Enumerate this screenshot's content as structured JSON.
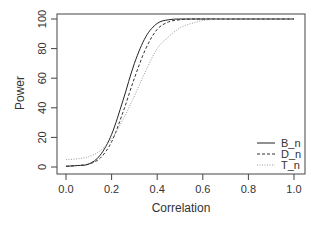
{
  "chart_data": {
    "type": "line",
    "title": "",
    "xlabel": "Correlation",
    "ylabel": "Power",
    "xlim": [
      0,
      1
    ],
    "ylim": [
      0,
      100
    ],
    "xticks": [
      "0.0",
      "0.2",
      "0.4",
      "0.6",
      "0.8",
      "1.0"
    ],
    "yticks": [
      "0",
      "20",
      "40",
      "60",
      "80",
      "100"
    ],
    "grid": false,
    "legend_position": "bottom-right",
    "x": [
      0.0,
      0.05,
      0.1,
      0.15,
      0.2,
      0.25,
      0.3,
      0.35,
      0.4,
      0.45,
      0.5,
      0.55,
      0.6,
      0.65,
      0.7,
      0.8,
      0.9,
      1.0
    ],
    "series": [
      {
        "name": "B_n",
        "style": "solid",
        "color": "#222222",
        "values": [
          0.5,
          1,
          2,
          8,
          22,
          45,
          70,
          88,
          97,
          99.5,
          100,
          100,
          100,
          100,
          100,
          100,
          100,
          100
        ]
      },
      {
        "name": "D_n",
        "style": "dashed",
        "color": "#333333",
        "values": [
          0.5,
          1,
          2,
          6,
          17,
          37,
          60,
          80,
          93,
          98,
          99.5,
          100,
          100,
          100,
          100,
          100,
          100,
          100
        ]
      },
      {
        "name": "T_n",
        "style": "dotted",
        "color": "#999999",
        "values": [
          5,
          5.5,
          7,
          11,
          19,
          32,
          48,
          65,
          80,
          88,
          94,
          97,
          99,
          99.7,
          100,
          100,
          100,
          100
        ]
      }
    ]
  }
}
